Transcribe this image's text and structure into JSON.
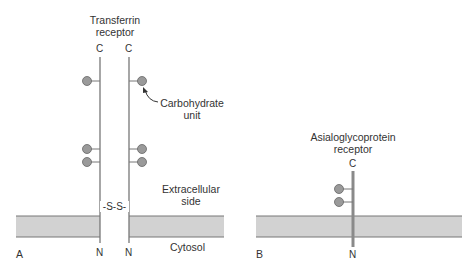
{
  "panel_a": {
    "title_line1": "Transferrin",
    "title_line2": "receptor",
    "terminal_top_left": "C",
    "terminal_top_right": "C",
    "terminal_bottom_left": "N",
    "terminal_bottom_right": "N",
    "disulfide_label": "-S-S-",
    "carbohydrate_line1": "Carbohydrate",
    "carbohydrate_line2": "unit",
    "extracellular_line1": "Extracellular",
    "extracellular_line2": "side",
    "cytosol_label": "Cytosol",
    "panel_letter": "A"
  },
  "panel_b": {
    "title_line1": "Asialoglycoprotein",
    "title_line2": "receptor",
    "terminal_top": "C",
    "terminal_bottom": "N",
    "panel_letter": "B"
  },
  "colors": {
    "membrane_fill": "#d2d2d2",
    "membrane_edge": "#777777",
    "chain": "#777777",
    "carbohydrate_fill": "#9a9a9a",
    "receptor_b_chain": "#8a8a8a"
  }
}
